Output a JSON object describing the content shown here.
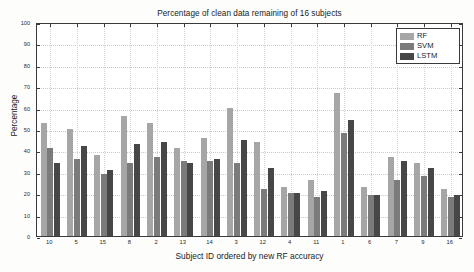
{
  "chart_data": {
    "type": "bar",
    "title": "Percentage of clean data remaining of 16 subjects",
    "xlabel": "Subject ID ordered by new RF accuracy",
    "ylabel": "Percentage",
    "categories": [
      "10",
      "5",
      "15",
      "8",
      "2",
      "13",
      "14",
      "3",
      "12",
      "4",
      "11",
      "1",
      "6",
      "7",
      "9",
      "16"
    ],
    "ylim": [
      0,
      100
    ],
    "yticks": [
      0,
      10,
      20,
      30,
      40,
      50,
      60,
      70,
      80,
      90,
      100
    ],
    "grid": true,
    "legend_position": "top-right",
    "series": [
      {
        "name": "RF",
        "color": "#a6a6a6",
        "values": [
          53,
          50,
          38,
          56,
          53,
          41,
          46,
          60,
          44,
          23,
          26,
          67,
          23,
          37,
          34,
          22
        ]
      },
      {
        "name": "SVM",
        "color": "#7b7b7b",
        "values": [
          41,
          36,
          29,
          34,
          37,
          35,
          35,
          34,
          22,
          20,
          18,
          48,
          19,
          26,
          28,
          18
        ]
      },
      {
        "name": "LSTM",
        "color": "#474747",
        "values": [
          34,
          42,
          31,
          43,
          44,
          34,
          36,
          45,
          32,
          20,
          21,
          54,
          19,
          35,
          32,
          19
        ]
      }
    ]
  }
}
